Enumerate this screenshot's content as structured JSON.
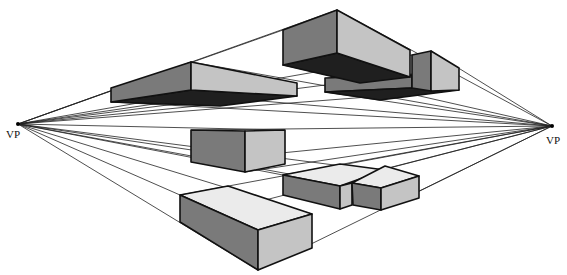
{
  "diagram": {
    "vanishing_points": [
      {
        "id": "left",
        "label": "VP",
        "x": 18,
        "y": 124
      },
      {
        "id": "right",
        "label": "VP",
        "x": 552,
        "y": 126
      }
    ],
    "colors": {
      "dark": "#1f1f1f",
      "mid": "#7a7a7a",
      "light": "#c4c4c4",
      "lighter": "#ebebeb",
      "line": "#111111"
    },
    "boxes": [
      {
        "id": "upper-left-box",
        "position": "above eye level"
      },
      {
        "id": "upper-right-large-box",
        "position": "above eye level"
      },
      {
        "id": "upper-right-small-box",
        "position": "above eye level"
      },
      {
        "id": "center-box",
        "position": "at eye level"
      },
      {
        "id": "lower-right-box-a",
        "position": "below eye level"
      },
      {
        "id": "lower-right-box-b",
        "position": "below eye level"
      },
      {
        "id": "bottom-box",
        "position": "below eye level"
      }
    ]
  }
}
